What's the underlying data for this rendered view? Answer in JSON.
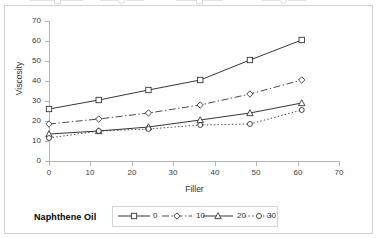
{
  "chart_data": {
    "type": "line",
    "title": "",
    "xlabel": "Filler",
    "ylabel": "Viscosity",
    "xlim": [
      0,
      70
    ],
    "ylim": [
      0,
      70
    ],
    "xticks": [
      "0",
      "10",
      "20",
      "30",
      "40",
      "50",
      "60",
      "70"
    ],
    "yticks": [
      "0",
      "10",
      "20",
      "30",
      "40",
      "50",
      "60",
      "70"
    ],
    "grid": false,
    "legend_position": "bottom",
    "legend_title": "Naphthene Oil",
    "x": [
      0,
      12,
      24,
      36.5,
      48.5,
      61
    ],
    "series": [
      {
        "name": "0",
        "marker": "open-square",
        "line_style": "solid",
        "values": [
          26,
          30.5,
          35.5,
          40.5,
          50.5,
          60.5
        ]
      },
      {
        "name": "10",
        "marker": "open-diamond",
        "line_style": "dash-dot",
        "values": [
          18.5,
          21,
          24,
          28,
          33.5,
          40.5
        ]
      },
      {
        "name": "20",
        "marker": "open-triangle",
        "line_style": "solid",
        "values": [
          13.5,
          15,
          17,
          20.5,
          24,
          29
        ]
      },
      {
        "name": "30",
        "marker": "open-circle",
        "line_style": "dotted",
        "values": [
          11.5,
          15,
          16,
          18,
          18.5,
          25.5
        ]
      }
    ]
  },
  "axis": {
    "y_label": "Viscosity",
    "x_label": "Filler",
    "y_tick_labels": [
      "70",
      "60",
      "50",
      "40",
      "30",
      "20",
      "10",
      "0"
    ],
    "x_tick_labels": [
      "0",
      "10",
      "20",
      "30",
      "40",
      "50",
      "60",
      "70"
    ]
  },
  "legend": {
    "title": "Naphthene Oil",
    "entries": [
      {
        "label": "0"
      },
      {
        "label": "10"
      },
      {
        "label": "20"
      },
      {
        "label": "30"
      }
    ]
  },
  "colors": {
    "line": "#2b2b2b",
    "axis": "#b5b5b5",
    "border": "#d2d2d2",
    "background": "#ffffff",
    "tick_text": "#3a3a3a"
  }
}
